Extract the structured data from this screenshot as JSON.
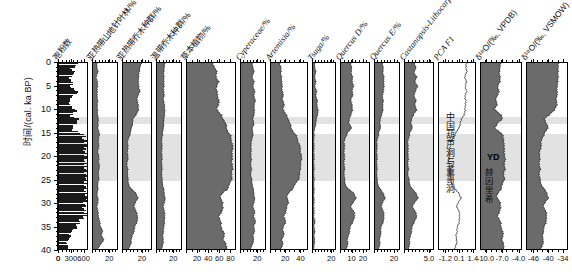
{
  "figure": {
    "type": "pollen-diagram",
    "yaxis": {
      "label": "时间/(cal. ka BP)",
      "ticks": [
        0,
        5,
        10,
        15,
        20,
        25,
        30,
        35,
        40
      ],
      "min": 0,
      "max": 40,
      "direction": "increasing-downward"
    },
    "shaded_bands": [
      {
        "name": "YD",
        "from": 11.5,
        "to": 13.0
      },
      {
        "name": "LGM",
        "from": 15.0,
        "to": 25.0
      }
    ],
    "annotations": {
      "cave_record": "中国葫芦洞与董哥洞",
      "yd_label": "YD",
      "heinrich_label": "赫因里希"
    }
  },
  "panels": [
    {
      "id": "pollen-count",
      "label": "孢粉数",
      "style": "sticks",
      "xmin": 0,
      "xmax": 700,
      "ticks": [
        0,
        300,
        600
      ],
      "ticklabels": [
        "0",
        "300",
        "600"
      ]
    },
    {
      "id": "subtropical-montane-conifer",
      "label": "亚热带山地针叶林/%",
      "style": "filled",
      "xmin": 0,
      "xmax": 30,
      "ticks": [
        0,
        20
      ],
      "ticklabels": [
        "",
        "20"
      ]
    },
    {
      "id": "subtropical-arbor",
      "label": "亚热带乔木种群/%",
      "style": "filled",
      "xmin": 0,
      "xmax": 30,
      "ticks": [
        0,
        20
      ],
      "ticklabels": [
        "",
        "20"
      ]
    },
    {
      "id": "temperate-arbor",
      "label": "温带乔木种群/%",
      "style": "filled",
      "xmin": 0,
      "xmax": 30,
      "ticks": [
        0,
        20
      ],
      "ticklabels": [
        "",
        "20"
      ]
    },
    {
      "id": "herbs",
      "label": "草本植物/%",
      "style": "filled",
      "xmin": 0,
      "xmax": 90,
      "ticks": [
        0,
        20,
        40,
        60,
        80
      ],
      "ticklabels": [
        "",
        "20",
        "40",
        "60",
        "80"
      ]
    },
    {
      "id": "cyperaceae",
      "label": "Cyperaceae/%",
      "style": "filled",
      "xmin": 0,
      "xmax": 30,
      "ticks": [
        0,
        20
      ],
      "ticklabels": [
        "",
        "20"
      ]
    },
    {
      "id": "artemisia",
      "label": "Artemisia/%",
      "style": "filled",
      "xmin": 0,
      "xmax": 50,
      "ticks": [
        0,
        20,
        40
      ],
      "ticklabels": [
        "",
        "20",
        "40"
      ]
    },
    {
      "id": "tsuga",
      "label": "Tsuga/%",
      "style": "filled",
      "xmin": 0,
      "xmax": 25,
      "ticks": [
        0,
        20
      ],
      "ticklabels": [
        "",
        "20"
      ]
    },
    {
      "id": "quercus-d",
      "label": "Quercus D/%",
      "style": "filled",
      "xmin": 0,
      "xmax": 26,
      "ticks": [
        0,
        10,
        20
      ],
      "ticklabels": [
        "",
        "10",
        "20"
      ]
    },
    {
      "id": "quercus-e",
      "label": "Quercus E/%",
      "style": "filled",
      "xmin": 0,
      "xmax": 26,
      "ticks": [
        0,
        20
      ],
      "ticklabels": [
        "",
        "20"
      ]
    },
    {
      "id": "castanopsis-lithocarpus",
      "label": "Castanopsis-Lithocarpus/%",
      "style": "filled",
      "xmin": 0,
      "xmax": 6,
      "ticks": [
        0,
        5.0
      ],
      "ticklabels": [
        "",
        "5.0"
      ]
    },
    {
      "id": "pca-f1",
      "label": "PCA F1",
      "style": "line",
      "xmin": -1.9,
      "xmax": 1.7,
      "ticks": [
        -1.2,
        0.1,
        1.4
      ],
      "ticklabels": [
        "-1.2",
        "0.1",
        "1.4"
      ]
    },
    {
      "id": "d18o-vpdb",
      "label": "δ¹⁸O/(‰, VPDB)",
      "style": "filled-reverse",
      "xmin": -11.0,
      "xmax": -3.4,
      "ticks": [
        -4.0,
        -7.0,
        -10.0
      ],
      "ticklabels": [
        "-4.0",
        "-7.0",
        "-10.0"
      ]
    },
    {
      "id": "d18o-vsmow",
      "label": "δ¹⁸O/(‰, VSMOW)",
      "style": "filled-reverse",
      "xmin": -49,
      "xmax": -32,
      "ticks": [
        -46,
        -40,
        -34
      ],
      "ticklabels": [
        "-46",
        "-40",
        "-34"
      ]
    }
  ],
  "colors": {
    "fill_dark": "#6b6b6b",
    "fill_mid": "#7d7d7d",
    "band": "#e2e2e2",
    "stroke": "#1c1c1c",
    "axis": "#000000"
  },
  "chart_data": {
    "type": "line",
    "title": "",
    "xlabel": "",
    "ylabel": "时间/(cal. ka BP)",
    "ylim": [
      0,
      40
    ],
    "grid": false,
    "legend": "none",
    "depth_axis_ka": [
      0,
      1,
      2,
      3,
      4,
      5,
      6,
      7,
      8,
      9,
      10,
      11,
      12,
      13,
      14,
      15,
      16,
      17,
      18,
      19,
      20,
      21,
      22,
      23,
      24,
      25,
      26,
      27,
      28,
      29,
      30,
      31,
      32,
      33,
      34,
      35,
      36,
      37,
      38,
      39,
      40
    ],
    "series": [
      {
        "name": "孢粉数",
        "unit": "grains",
        "values": [
          520,
          300,
          410,
          250,
          360,
          290,
          480,
          330,
          250,
          300,
          420,
          300,
          520,
          380,
          300,
          660,
          620,
          700,
          650,
          690,
          700,
          640,
          700,
          680,
          700,
          660,
          700,
          690,
          700,
          700,
          660,
          620,
          700,
          600,
          500,
          420,
          260,
          300,
          180,
          240,
          160
        ]
      },
      {
        "name": "亚热带山地针叶林/%",
        "unit": "%",
        "values": [
          5,
          5,
          6,
          4,
          5,
          6,
          5,
          5,
          6,
          5,
          6,
          5,
          7,
          6,
          6,
          8,
          7,
          7,
          7,
          6,
          7,
          7,
          8,
          7,
          7,
          7,
          6,
          6,
          5,
          6,
          6,
          5,
          6,
          7,
          8,
          9,
          12,
          10,
          14,
          9,
          6
        ]
      },
      {
        "name": "亚热带乔木种群/%",
        "unit": "%",
        "values": [
          20,
          18,
          17,
          17,
          16,
          17,
          18,
          16,
          15,
          16,
          17,
          14,
          11,
          10,
          9,
          8,
          6,
          5,
          5,
          5,
          5,
          5,
          4,
          5,
          5,
          5,
          6,
          8,
          14,
          16,
          13,
          12,
          14,
          16,
          15,
          13,
          12,
          10,
          9,
          8,
          6
        ]
      },
      {
        "name": "温带乔木种群/%",
        "unit": "%",
        "values": [
          10,
          9,
          8,
          9,
          8,
          9,
          8,
          9,
          8,
          9,
          10,
          9,
          9,
          8,
          8,
          7,
          6,
          6,
          6,
          6,
          6,
          6,
          6,
          6,
          6,
          6,
          7,
          8,
          9,
          10,
          9,
          8,
          9,
          10,
          9,
          9,
          8,
          7,
          8,
          7,
          6
        ]
      },
      {
        "name": "草本植物/%",
        "unit": "%",
        "values": [
          48,
          52,
          55,
          55,
          58,
          56,
          55,
          57,
          60,
          58,
          56,
          62,
          68,
          72,
          74,
          78,
          82,
          84,
          85,
          85,
          84,
          84,
          85,
          84,
          84,
          83,
          80,
          76,
          66,
          62,
          66,
          68,
          64,
          60,
          62,
          64,
          66,
          70,
          68,
          72,
          76
        ]
      },
      {
        "name": "Cyperaceae/%",
        "unit": "%",
        "values": [
          14,
          15,
          16,
          14,
          16,
          15,
          17,
          16,
          18,
          16,
          17,
          16,
          15,
          16,
          14,
          15,
          14,
          13,
          12,
          13,
          12,
          13,
          12,
          13,
          12,
          13,
          14,
          15,
          16,
          17,
          16,
          15,
          17,
          16,
          18,
          16,
          17,
          15,
          16,
          14,
          12
        ]
      },
      {
        "name": "Artemisia/%",
        "unit": "%",
        "values": [
          12,
          14,
          13,
          15,
          14,
          16,
          15,
          17,
          16,
          18,
          17,
          20,
          24,
          26,
          28,
          32,
          36,
          38,
          40,
          41,
          42,
          42,
          41,
          40,
          40,
          38,
          34,
          30,
          24,
          22,
          24,
          22,
          20,
          18,
          20,
          18,
          16,
          18,
          15,
          16,
          14
        ]
      },
      {
        "name": "Tsuga/%",
        "unit": "%",
        "values": [
          2,
          2,
          3,
          2,
          3,
          2,
          4,
          3,
          5,
          4,
          6,
          5,
          4,
          3,
          2,
          1,
          1,
          1,
          1,
          1,
          1,
          1,
          1,
          1,
          1,
          1,
          1,
          1,
          1,
          1,
          1,
          1,
          1,
          1,
          2,
          1,
          2,
          1,
          2,
          1,
          1
        ]
      },
      {
        "name": "Quercus D/%",
        "unit": "%",
        "values": [
          9,
          10,
          9,
          11,
          10,
          12,
          10,
          11,
          9,
          10,
          11,
          9,
          8,
          7,
          10,
          6,
          4,
          3,
          3,
          3,
          3,
          3,
          3,
          3,
          3,
          3,
          4,
          6,
          12,
          14,
          11,
          9,
          12,
          13,
          11,
          9,
          8,
          7,
          6,
          6,
          5
        ]
      },
      {
        "name": "Quercus E/%",
        "unit": "%",
        "values": [
          8,
          9,
          8,
          10,
          9,
          10,
          9,
          8,
          9,
          8,
          9,
          7,
          6,
          5,
          6,
          4,
          3,
          2,
          2,
          2,
          2,
          2,
          2,
          2,
          2,
          2,
          3,
          5,
          9,
          11,
          8,
          7,
          9,
          10,
          9,
          7,
          6,
          6,
          5,
          5,
          4
        ]
      },
      {
        "name": "Castanopsis-Lithocarpus/%",
        "unit": "%",
        "values": [
          2.0,
          2.4,
          1.8,
          2.6,
          2.0,
          2.8,
          2.2,
          1.9,
          2.4,
          2.0,
          2.6,
          1.8,
          1.5,
          1.2,
          1.6,
          1.0,
          0.8,
          0.6,
          0.6,
          0.7,
          0.6,
          0.7,
          0.6,
          0.7,
          0.6,
          0.8,
          1.0,
          1.4,
          2.4,
          2.8,
          2.0,
          1.6,
          2.2,
          2.6,
          2.0,
          1.6,
          1.4,
          1.2,
          1.0,
          0.9,
          0.8
        ]
      },
      {
        "name": "PCA F1",
        "unit": "",
        "values": [
          0.9,
          0.8,
          0.85,
          0.7,
          0.8,
          0.75,
          0.85,
          0.7,
          0.8,
          0.7,
          0.75,
          0.6,
          0.4,
          0.2,
          0.1,
          -0.2,
          -0.5,
          -0.7,
          -0.8,
          -0.85,
          -0.9,
          -0.9,
          -0.85,
          -0.85,
          -0.8,
          -0.75,
          -0.6,
          -0.4,
          0.1,
          0.3,
          0.0,
          -0.1,
          0.1,
          0.2,
          0.1,
          0.0,
          -0.1,
          -0.2,
          -0.1,
          -0.2,
          -0.3
        ]
      },
      {
        "name": "δ¹⁸O/(‰, VPDB)",
        "unit": "‰",
        "values": [
          -7.2,
          -7.4,
          -7.6,
          -7.3,
          -7.5,
          -7.8,
          -7.6,
          -7.9,
          -8.2,
          -8.0,
          -8.4,
          -7.4,
          -6.8,
          -8.0,
          -8.4,
          -7.2,
          -6.8,
          -6.6,
          -6.7,
          -6.5,
          -6.6,
          -6.4,
          -6.6,
          -6.5,
          -6.7,
          -6.6,
          -6.9,
          -7.2,
          -7.8,
          -8.0,
          -7.4,
          -7.2,
          -7.6,
          -7.8,
          -7.4,
          -7.2,
          -7.0,
          -6.8,
          -7.0,
          -6.8,
          -6.6
        ]
      },
      {
        "name": "δ¹⁸O/(‰, VSMOW)",
        "unit": "‰",
        "values": [
          -35.5,
          -35.8,
          -36.0,
          -35.6,
          -36.2,
          -36.0,
          -36.4,
          -36.2,
          -36.6,
          -36.4,
          -37.0,
          -39.5,
          -41.5,
          -41.0,
          -40.0,
          -41.5,
          -42.5,
          -43.0,
          -43.2,
          -43.5,
          -43.8,
          -43.6,
          -43.8,
          -43.5,
          -43.8,
          -43.6,
          -43.0,
          -42.0,
          -40.5,
          -40.0,
          -41.5,
          -42.0,
          -41.0,
          -40.5,
          -41.0,
          -41.5,
          -42.0,
          -42.5,
          -42.0,
          -42.5,
          -43.0
        ]
      }
    ]
  }
}
